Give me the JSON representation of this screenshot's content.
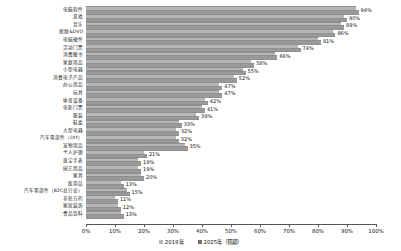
{
  "chart_data": {
    "type": "bar",
    "orientation": "horizontal",
    "title": "",
    "xlabel": "",
    "ylabel": "",
    "xlim": [
      0,
      100
    ],
    "grid": false,
    "legend_position": "bottom",
    "categories": [
      "电脑软件",
      "游戏",
      "音乐",
      "视频&DVD",
      "电脑硬件",
      "活动门票",
      "消费图书",
      "家庭用品",
      "小型电器",
      "消费电子产品",
      "办公用品",
      "玩具",
      "体育设备",
      "电影门票",
      "服装",
      "鞋类",
      "大型电器",
      "汽车零部件（DIY）",
      "宠物用品",
      "个人护理",
      "珠宝手表",
      "园艺用品",
      "家具",
      "医用品",
      "汽车零部件（B2C总行业）",
      "非处方药",
      "家居装饰",
      "食品饮料"
    ],
    "series": [
      {
        "name": "2019年",
        "values": [
          93,
          89,
          88,
          85,
          80,
          73,
          65,
          57,
          54,
          51,
          46,
          46,
          41,
          40,
          38,
          32,
          31,
          31,
          34,
          20,
          18,
          18,
          19,
          12,
          14,
          10,
          11,
          12
        ]
      },
      {
        "name": "2025年（预期）",
        "values": [
          94,
          90,
          89,
          86,
          81,
          74,
          66,
          58,
          55,
          52,
          47,
          47,
          42,
          41,
          39,
          33,
          32,
          32,
          35,
          21,
          19,
          19,
          20,
          13,
          15,
          11,
          12,
          13
        ]
      }
    ],
    "data_labels": [
      "94%",
      "90%",
      "89%",
      "86%",
      "81%",
      "74%",
      "66%",
      "58%",
      "55%",
      "52%",
      "47%",
      "47%",
      "42%",
      "41%",
      "39%",
      "33%",
      "32%",
      "32%",
      "35%",
      "21%",
      "19%",
      "19%",
      "20%",
      "13%",
      "15%",
      "11%",
      "12%",
      "13%"
    ],
    "xticks": [
      0,
      10,
      20,
      30,
      40,
      50,
      60,
      70,
      80,
      90,
      100
    ],
    "xticklabels": [
      "0%",
      "10%",
      "20%",
      "30%",
      "40%",
      "50%",
      "60%",
      "70%",
      "80%",
      "90%",
      "100%"
    ],
    "legend": [
      "2019年",
      "2025年（预期）"
    ],
    "colors": {
      "series_2019": "#b6b6b6",
      "series_2025": "#6f6f6f",
      "axis": "#555555",
      "text": "#111111"
    }
  }
}
